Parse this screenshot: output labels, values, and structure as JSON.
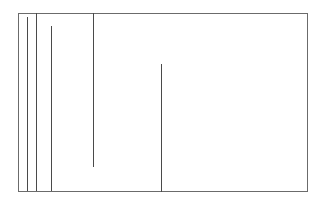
{
  "diagram": {
    "background": "#ffffff",
    "frame": {
      "left": 18,
      "top": 13,
      "right": 307,
      "bottom": 191,
      "color": "#6b6b6b"
    },
    "line_color": "#4a4a4a",
    "vertical_lines": [
      {
        "x": 27,
        "y1": 17,
        "y2": 190
      },
      {
        "x": 36,
        "y1": 13,
        "y2": 190
      },
      {
        "x": 51,
        "y1": 26,
        "y2": 190
      },
      {
        "x": 93,
        "y1": 13,
        "y2": 166
      },
      {
        "x": 161,
        "y1": 64,
        "y2": 191
      }
    ]
  }
}
